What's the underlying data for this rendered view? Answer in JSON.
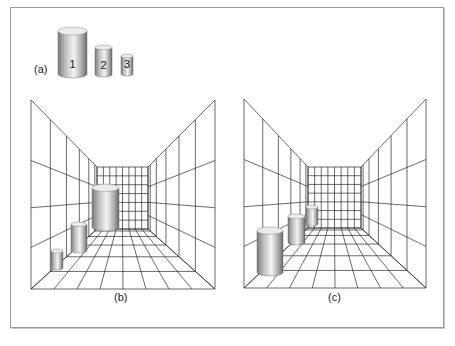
{
  "figure": {
    "frame": {
      "x": 10,
      "y": 7,
      "w": 434,
      "h": 321,
      "color": "#9a9a9a"
    },
    "colors": {
      "grid": "#2a2a2a",
      "cyl_dark": "#6e6e6e",
      "cyl_mid": "#c4c4c4",
      "cyl_light": "#f2f2f2",
      "cyl_top": "#ececec"
    }
  },
  "panel_a": {
    "label": "(a)",
    "label_pos": {
      "x": 34,
      "y": 63
    },
    "cylinders": [
      {
        "id": "1",
        "label": "1",
        "x": 58,
        "w": 29,
        "top": 27,
        "bottom": 78
      },
      {
        "id": "2",
        "label": "2",
        "x": 95,
        "w": 17,
        "top": 45,
        "bottom": 77
      },
      {
        "id": "3",
        "label": "3",
        "x": 121,
        "w": 12,
        "top": 54,
        "bottom": 76
      }
    ]
  },
  "panel_b": {
    "label": "(b)",
    "label_pos": {
      "x": 114,
      "y": 291
    },
    "room": {
      "outer": {
        "left": 31,
        "right": 215,
        "top": 100,
        "bottom": 289
      },
      "back": {
        "left": 97,
        "right": 148,
        "top": 167,
        "bottom": 229
      },
      "back_cols": 8,
      "back_rows": 7,
      "side_cols": 6,
      "wall_rows": [
        0.0,
        0.32,
        0.57,
        0.78,
        1.0
      ],
      "floor_cols": 8,
      "floor_rows": 6
    },
    "cylinders": [
      {
        "id": "large",
        "x": 92,
        "w": 27,
        "top": 184,
        "bottom": 231
      },
      {
        "id": "medium",
        "x": 71,
        "w": 16,
        "top": 222,
        "bottom": 253
      },
      {
        "id": "small",
        "x": 51,
        "w": 12,
        "top": 249,
        "bottom": 270
      }
    ]
  },
  "panel_c": {
    "label": "(c)",
    "label_pos": {
      "x": 328,
      "y": 291
    },
    "room": {
      "outer": {
        "left": 244,
        "right": 426,
        "top": 99,
        "bottom": 288
      },
      "back": {
        "left": 308,
        "right": 361,
        "top": 167,
        "bottom": 228
      },
      "back_cols": 8,
      "back_rows": 7,
      "side_cols": 6,
      "wall_rows": [
        0.0,
        0.32,
        0.57,
        0.78,
        1.0
      ],
      "floor_cols": 8,
      "floor_rows": 6
    },
    "cylinders": [
      {
        "id": "small",
        "x": 306,
        "w": 12,
        "top": 205,
        "bottom": 226
      },
      {
        "id": "medium",
        "x": 288,
        "w": 17,
        "top": 214,
        "bottom": 245
      },
      {
        "id": "large",
        "x": 257,
        "w": 26,
        "top": 227,
        "bottom": 276
      }
    ]
  }
}
